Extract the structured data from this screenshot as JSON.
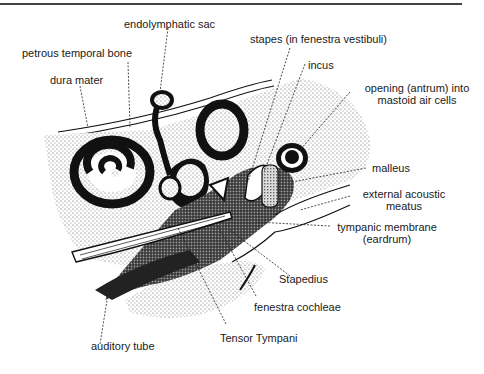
{
  "figure": {
    "labels": {
      "endolymphatic_sac": "endolymphatic sac",
      "petrous_temporal_bone": "petrous temporal bone",
      "dura_mater": "dura mater",
      "stapes": "stapes (in fenestra vestibuli)",
      "incus": "incus",
      "antrum_line1": "opening (antrum) into",
      "antrum_line2": "mastoid air cells",
      "malleus": "malleus",
      "external_meatus_line1": "external acoustic",
      "external_meatus_line2": "meatus",
      "tympanic_line1": "tympanic membrane",
      "tympanic_line2": "(eardrum)",
      "stapedius": "Stapedius",
      "fenestra_cochleae": "fenestra cochleae",
      "tensor_tympani": "Tensor Tympani",
      "auditory_tube": "auditory tube"
    },
    "colors": {
      "ink": "#111111",
      "stipple": "#8a8a8a",
      "paper": "#ffffff"
    }
  }
}
